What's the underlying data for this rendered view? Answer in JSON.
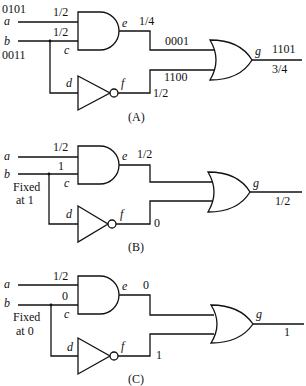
{
  "figure": {
    "panels": [
      {
        "id": "A",
        "caption": "(A)",
        "inputs": {
          "a_label": "a",
          "b_label": "b",
          "a_bits": "0101",
          "b_bits": "0011"
        },
        "annotations": {
          "a_prob": "1/2",
          "b_prob": "1/2",
          "e_prob": "1/4",
          "e_bits": "0001",
          "f_bits": "1100",
          "f_prob": "1/2",
          "g_bits": "1101",
          "g_prob": "3/4"
        },
        "nodes": {
          "c": "c",
          "d": "d",
          "e": "e",
          "f": "f",
          "g": "g"
        }
      },
      {
        "id": "B",
        "caption": "(B)",
        "inputs": {
          "a_label": "a",
          "b_label": "b",
          "fixed_line1": "Fixed",
          "fixed_line2": "at 1"
        },
        "annotations": {
          "a_prob": "1/2",
          "b_val": "1",
          "e_prob": "1/2",
          "f_val": "0",
          "g_prob": "1/2"
        },
        "nodes": {
          "c": "c",
          "d": "d",
          "e": "e",
          "f": "f",
          "g": "g"
        }
      },
      {
        "id": "C",
        "caption": "(C)",
        "inputs": {
          "a_label": "a",
          "b_label": "b",
          "fixed_line1": "Fixed",
          "fixed_line2": "at 0"
        },
        "annotations": {
          "a_prob": "1/2",
          "b_val": "0",
          "e_val": "0",
          "f_val": "1",
          "g_val": "1"
        },
        "nodes": {
          "c": "c",
          "d": "d",
          "e": "e",
          "f": "f",
          "g": "g"
        }
      }
    ]
  }
}
